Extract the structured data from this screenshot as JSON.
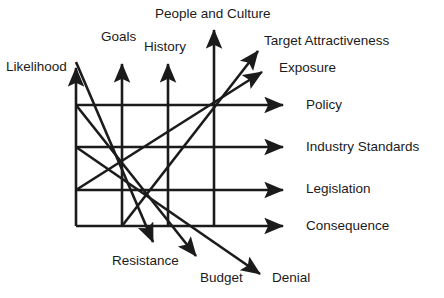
{
  "diagram": {
    "type": "arrow-grid-diagram",
    "stroke_color": "#1b1b1b",
    "background_color": "#ffffff",
    "label_color": "#1b1b1b",
    "canvas": {
      "width": 444,
      "height": 298
    },
    "grid": {
      "vertical_lines_x": [
        76,
        122,
        168,
        214
      ],
      "horizontal_lines_y": [
        105,
        147,
        190,
        226
      ],
      "left_x": 76,
      "bottom_y": 226
    },
    "labels": {
      "likelihood": "Likelihood",
      "goals": "Goals",
      "history": "History",
      "people_and_culture": "People and Culture",
      "target_attractiveness": "Target Attractiveness",
      "exposure": "Exposure",
      "policy": "Policy",
      "industry_standards": "Industry Standards",
      "legislation": "Legislation",
      "consequence": "Consequence",
      "resistance": "Resistance",
      "budget": "Budget",
      "denial": "Denial"
    },
    "arrows": {
      "up": [
        {
          "name": "likelihood",
          "x": 76,
          "from_y": 226,
          "to_y": 62
        },
        {
          "name": "goals",
          "x": 122,
          "from_y": 226,
          "to_y": 58
        },
        {
          "name": "history",
          "x": 168,
          "from_y": 226,
          "to_y": 58
        },
        {
          "name": "people-and-culture",
          "x": 214,
          "from_y": 226,
          "to_y": 24
        }
      ],
      "right": [
        {
          "name": "policy",
          "y": 105,
          "from_x": 76,
          "to_x": 289
        },
        {
          "name": "industry-standards",
          "y": 147,
          "from_x": 76,
          "to_x": 289
        },
        {
          "name": "legislation",
          "y": 190,
          "from_x": 76,
          "to_x": 289
        },
        {
          "name": "consequence",
          "y": 226,
          "from_x": 76,
          "to_x": 289
        }
      ],
      "up_right_diagonal": [
        {
          "name": "target-attractiveness",
          "from_x": 122,
          "from_y": 226,
          "to_x": 263,
          "to_y": 45
        },
        {
          "name": "exposure",
          "from_x": 76,
          "from_y": 190,
          "to_x": 268,
          "to_y": 67
        }
      ],
      "down_right_diagonal": [
        {
          "name": "resistance",
          "from_x": 76,
          "from_y": 62,
          "to_x": 157,
          "to_y": 248
        },
        {
          "name": "budget",
          "from_x": 76,
          "from_y": 105,
          "to_x": 201,
          "to_y": 262
        },
        {
          "name": "denial",
          "from_x": 76,
          "from_y": 147,
          "to_x": 266,
          "to_y": 279
        }
      ]
    }
  }
}
